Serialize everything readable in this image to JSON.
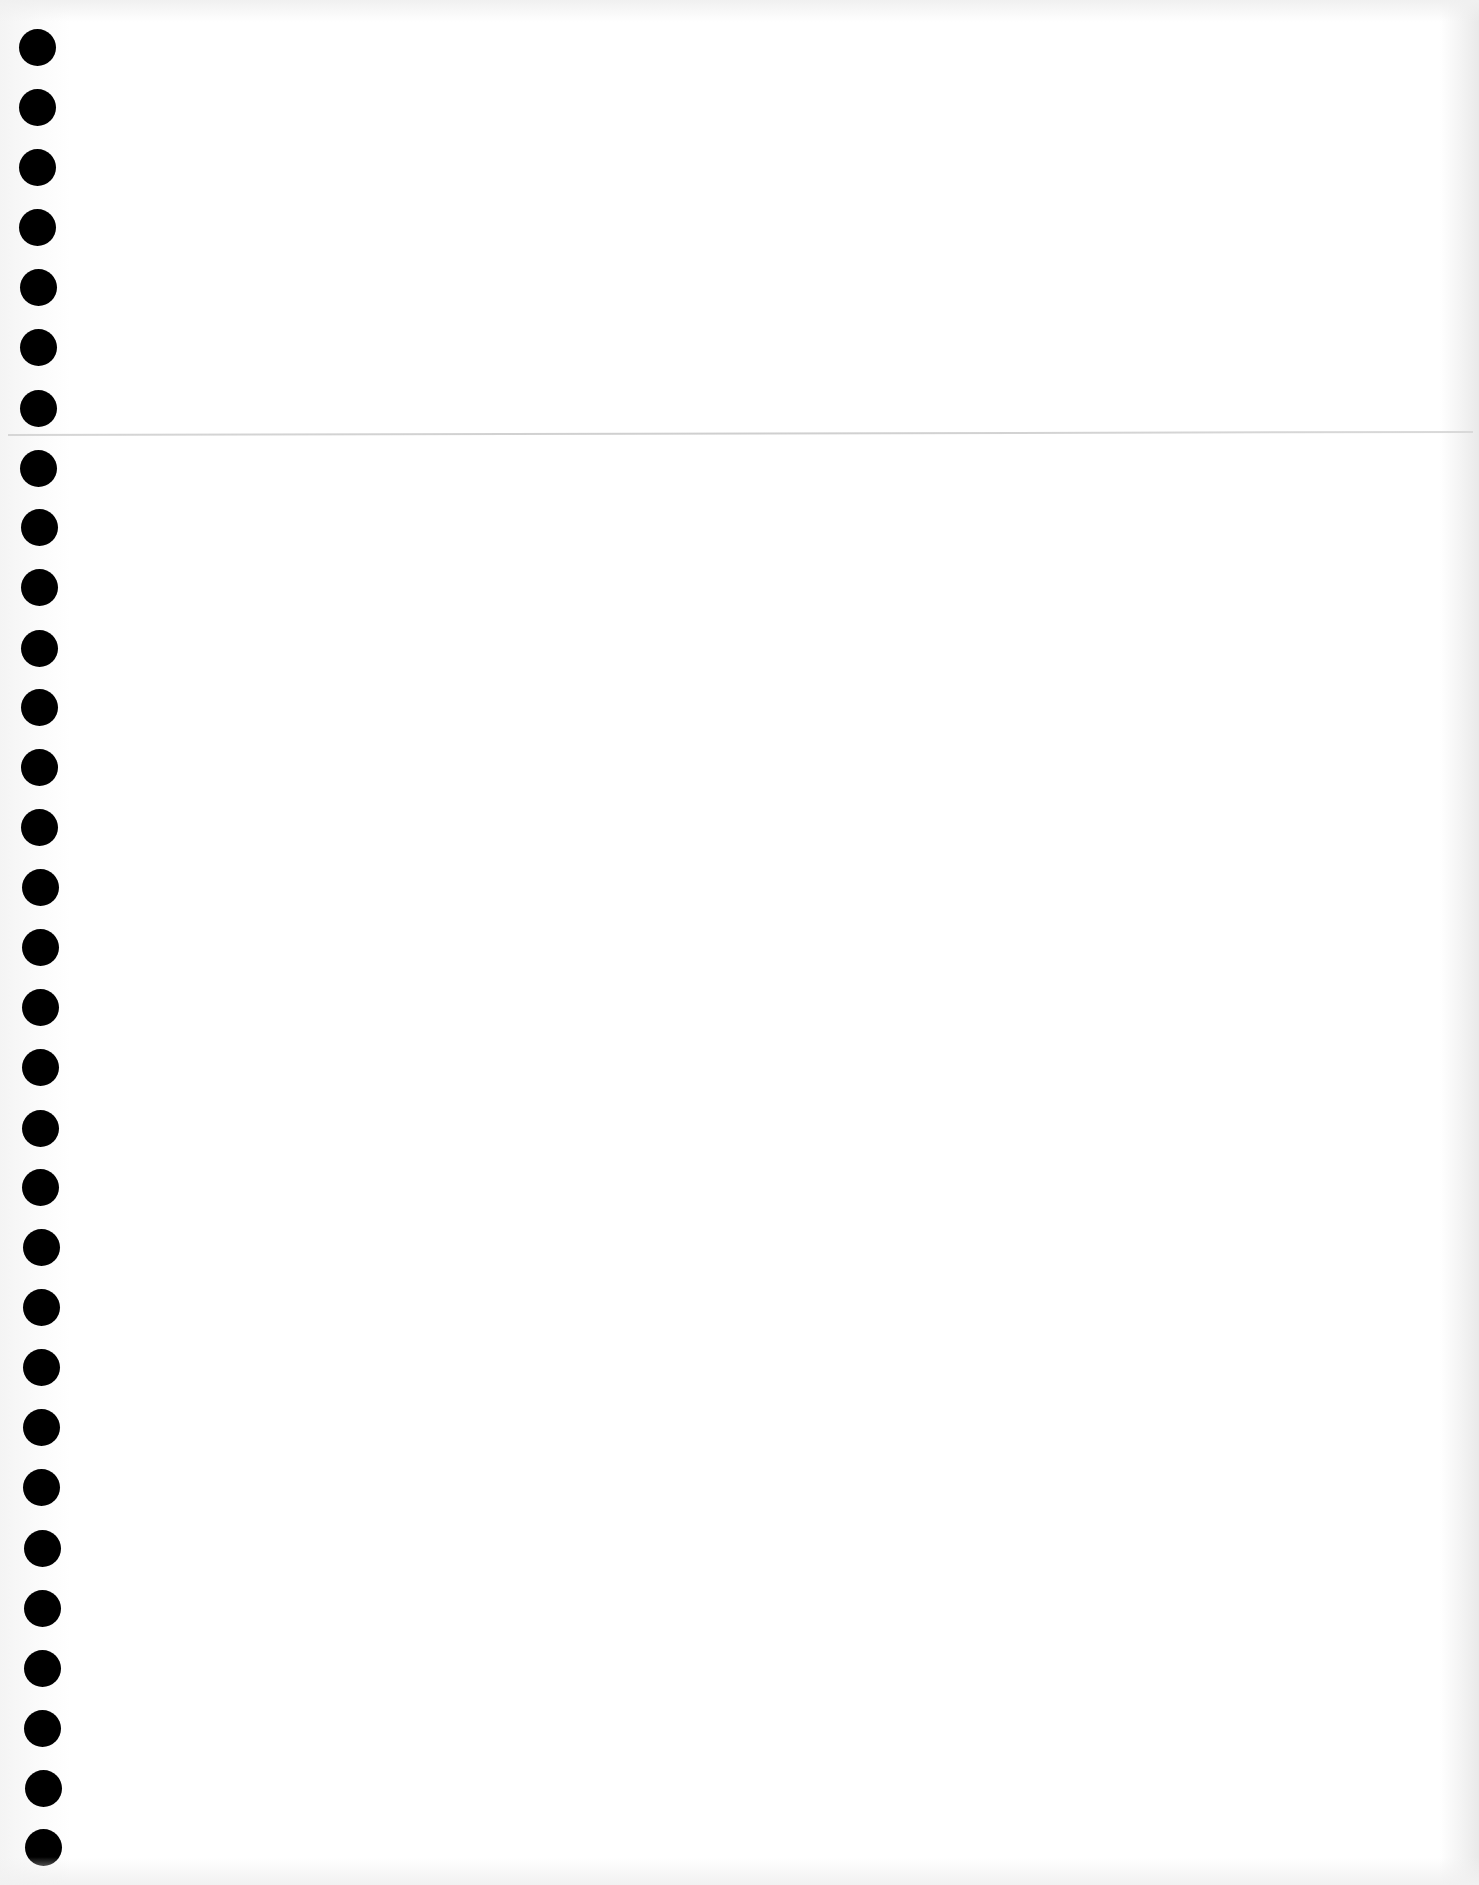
{
  "page": {
    "type": "blank punched notebook page",
    "background_color": "#ffffff",
    "text_content": []
  },
  "punch_holes": {
    "count": 31,
    "color": "#000000",
    "diameter_px": 37,
    "positions": [
      {
        "x": 37,
        "y": 47
      },
      {
        "x": 37,
        "y": 107
      },
      {
        "x": 37,
        "y": 167
      },
      {
        "x": 37,
        "y": 227
      },
      {
        "x": 38,
        "y": 287
      },
      {
        "x": 38,
        "y": 347
      },
      {
        "x": 38,
        "y": 408
      },
      {
        "x": 38,
        "y": 468
      },
      {
        "x": 39,
        "y": 527
      },
      {
        "x": 39,
        "y": 587
      },
      {
        "x": 39,
        "y": 648
      },
      {
        "x": 39,
        "y": 707
      },
      {
        "x": 39,
        "y": 767
      },
      {
        "x": 39,
        "y": 827
      },
      {
        "x": 40,
        "y": 887
      },
      {
        "x": 40,
        "y": 947
      },
      {
        "x": 40,
        "y": 1007
      },
      {
        "x": 40,
        "y": 1067
      },
      {
        "x": 40,
        "y": 1128
      },
      {
        "x": 40,
        "y": 1187
      },
      {
        "x": 41,
        "y": 1247
      },
      {
        "x": 41,
        "y": 1307
      },
      {
        "x": 41,
        "y": 1367
      },
      {
        "x": 41,
        "y": 1427
      },
      {
        "x": 41,
        "y": 1487
      },
      {
        "x": 42,
        "y": 1548
      },
      {
        "x": 42,
        "y": 1608
      },
      {
        "x": 42,
        "y": 1668
      },
      {
        "x": 42,
        "y": 1728
      },
      {
        "x": 43,
        "y": 1788
      },
      {
        "x": 43,
        "y": 1847
      }
    ]
  },
  "rule_line": {
    "y": 434,
    "color": "#d2d2d2"
  }
}
